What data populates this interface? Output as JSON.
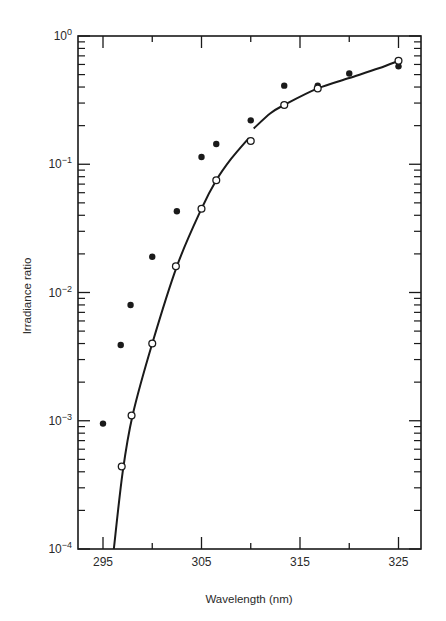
{
  "chart_data": {
    "type": "scatter",
    "title": "",
    "xlabel": "Wavelength (nm)",
    "ylabel": "Irradiance ratio",
    "xlim": [
      292.5,
      326.8
    ],
    "ylim": [
      0.0001,
      1
    ],
    "yscale": "log",
    "grid": false,
    "legend": null,
    "x_ticks": [
      295,
      305,
      315,
      325
    ],
    "x_tick_labels": [
      "295",
      "305",
      "315",
      "325"
    ],
    "x_minor_ticks": [
      300,
      310,
      320
    ],
    "y_ticks": [
      1,
      0.1,
      0.01,
      0.001,
      0.0001
    ],
    "y_tick_labels": [
      {
        "base": "10",
        "exp": "0"
      },
      {
        "base": "10",
        "exp": "−1"
      },
      {
        "base": "10",
        "exp": "−2"
      },
      {
        "base": "10",
        "exp": "−3"
      },
      {
        "base": "10",
        "exp": "−4"
      }
    ],
    "series": [
      {
        "name": "filled circles",
        "marker": "filled-circle",
        "x": [
          295.0,
          296.8,
          297.8,
          300.0,
          302.5,
          305.0,
          306.5,
          310.0,
          313.4,
          316.8,
          320.0,
          325.0
        ],
        "y": [
          0.00095,
          0.0039,
          0.008,
          0.019,
          0.043,
          0.114,
          0.144,
          0.22,
          0.41,
          0.41,
          0.51,
          0.58
        ]
      },
      {
        "name": "open circles",
        "marker": "open-circle",
        "x": [
          296.9,
          297.9,
          300.0,
          302.4,
          305.0,
          306.5,
          310.0,
          313.4,
          316.8,
          325.0
        ],
        "y": [
          0.00044,
          0.0011,
          0.004,
          0.016,
          0.045,
          0.075,
          0.152,
          0.29,
          0.39,
          0.64
        ]
      },
      {
        "name": "fitted curve",
        "marker": "line",
        "segments": [
          {
            "x": [
              296.1,
              297.0,
              298.0,
              300.0,
              302.5,
              305.0,
              306.5,
              308.0,
              309.8
            ],
            "y": [
              0.0001,
              0.0004,
              0.0011,
              0.004,
              0.016,
              0.045,
              0.075,
              0.11,
              0.16
            ]
          },
          {
            "x": [
              310.3,
              312.0,
              313.4,
              316.8,
              320.0,
              323.0,
              325.0
            ],
            "y": [
              0.19,
              0.25,
              0.29,
              0.39,
              0.47,
              0.56,
              0.64
            ]
          }
        ]
      }
    ]
  },
  "colors": {
    "ink": "#1a1a1a",
    "background": "#ffffff"
  }
}
